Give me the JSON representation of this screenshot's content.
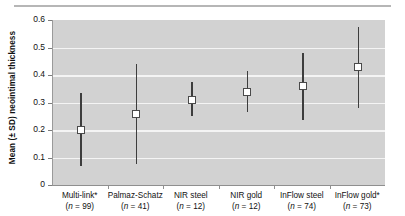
{
  "axes": {
    "ylabel": "Mean (± SD) neointimal thickness",
    "xlabel": "",
    "yticks": [
      "0.6",
      "0.5",
      "0.4",
      "0.3",
      "0.2",
      "0.1",
      "0"
    ]
  },
  "chart_data": {
    "type": "scatter",
    "title": "",
    "subtitle": "",
    "xlabel": "",
    "ylabel": "Mean (± SD) neointimal thickness",
    "ylim": [
      0,
      0.6
    ],
    "ytick_values": [
      0,
      0.1,
      0.2,
      0.3,
      0.4,
      0.5,
      0.6
    ],
    "grid": true,
    "legend": "none",
    "error_type": "SD",
    "categories": [
      "Multi-link*",
      "Palmaz-Schatz",
      "NIR steel",
      "NIR gold",
      "InFlow steel",
      "InFlow gold*"
    ],
    "n_labels": [
      "(n = 99)",
      "(n = 41)",
      "(n = 12)",
      "(n = 12)",
      "(n = 74)",
      "(n = 73)"
    ],
    "n_values": [
      99,
      41,
      12,
      12,
      74,
      73
    ],
    "means": [
      0.2,
      0.26,
      0.31,
      0.34,
      0.36,
      0.43
    ],
    "sd_low": [
      0.07,
      0.075,
      0.25,
      0.265,
      0.235,
      0.28
    ],
    "sd_high": [
      0.335,
      0.44,
      0.375,
      0.415,
      0.48,
      0.575
    ],
    "marker": "white-square",
    "annotations": [
      "* denotes marked categories"
    ]
  },
  "points": [
    {
      "label": "Multi-link*",
      "n_label": "(n = 99)",
      "mean": 0.2,
      "low": 0.07,
      "high": 0.335
    },
    {
      "label": "Palmaz-Schatz",
      "n_label": "(n = 41)",
      "mean": 0.26,
      "low": 0.075,
      "high": 0.44
    },
    {
      "label": "NIR steel",
      "n_label": "(n = 12)",
      "mean": 0.31,
      "low": 0.25,
      "high": 0.375
    },
    {
      "label": "NIR gold",
      "n_label": "(n = 12)",
      "mean": 0.34,
      "low": 0.265,
      "high": 0.415
    },
    {
      "label": "InFlow steel",
      "n_label": "(n = 74)",
      "mean": 0.36,
      "low": 0.235,
      "high": 0.48
    },
    {
      "label": "InFlow gold*",
      "n_label": "(n = 73)",
      "mean": 0.43,
      "low": 0.28,
      "high": 0.575
    }
  ],
  "colors": {
    "plot_background": "#d2d2d2",
    "gridline": "#f4f4f4",
    "whisker": "#3d3d3d",
    "marker_fill": "#ffffff",
    "marker_edge": "#4a4a4a",
    "axis": "#8f8f8f",
    "text": "#111111",
    "page_background": "#ffffff",
    "top_rule": "#b6b6b6"
  }
}
